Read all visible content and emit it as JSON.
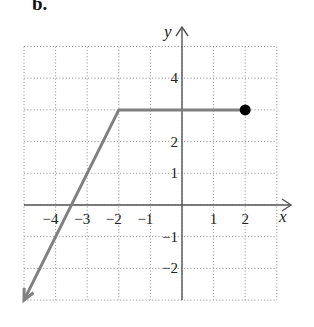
{
  "panel_label": "b.",
  "chart_data": {
    "type": "line",
    "title": "",
    "xlabel": "x",
    "ylabel": "y",
    "xlim": [
      -5,
      3
    ],
    "ylim": [
      -3,
      5
    ],
    "grid": true,
    "grid_style": "dotted",
    "x_ticks": [
      -4,
      -3,
      -2,
      -1,
      1,
      2
    ],
    "x_tick_labels": [
      "−4",
      "−3",
      "−2",
      "−1",
      "1",
      "2"
    ],
    "y_ticks": [
      4,
      2,
      1,
      -1,
      -2
    ],
    "y_tick_labels": [
      "4",
      "2",
      "1",
      "−1",
      "−2"
    ],
    "series": [
      {
        "name": "piecewise",
        "color": "#808080",
        "points": [
          [
            -5,
            -3
          ],
          [
            -2,
            3
          ],
          [
            2,
            3
          ]
        ],
        "start_marker": "arrow",
        "end_marker": "closed-dot",
        "end_marker_color": "#000000"
      }
    ],
    "segments": [
      {
        "from": [
          -5,
          -3
        ],
        "to": [
          -2,
          3
        ],
        "description": "slope 2 line, arrow continues down-left"
      },
      {
        "from": [
          -2,
          3
        ],
        "to": [
          2,
          3
        ],
        "description": "horizontal segment y = 3, closed endpoint at x = 2"
      }
    ]
  }
}
